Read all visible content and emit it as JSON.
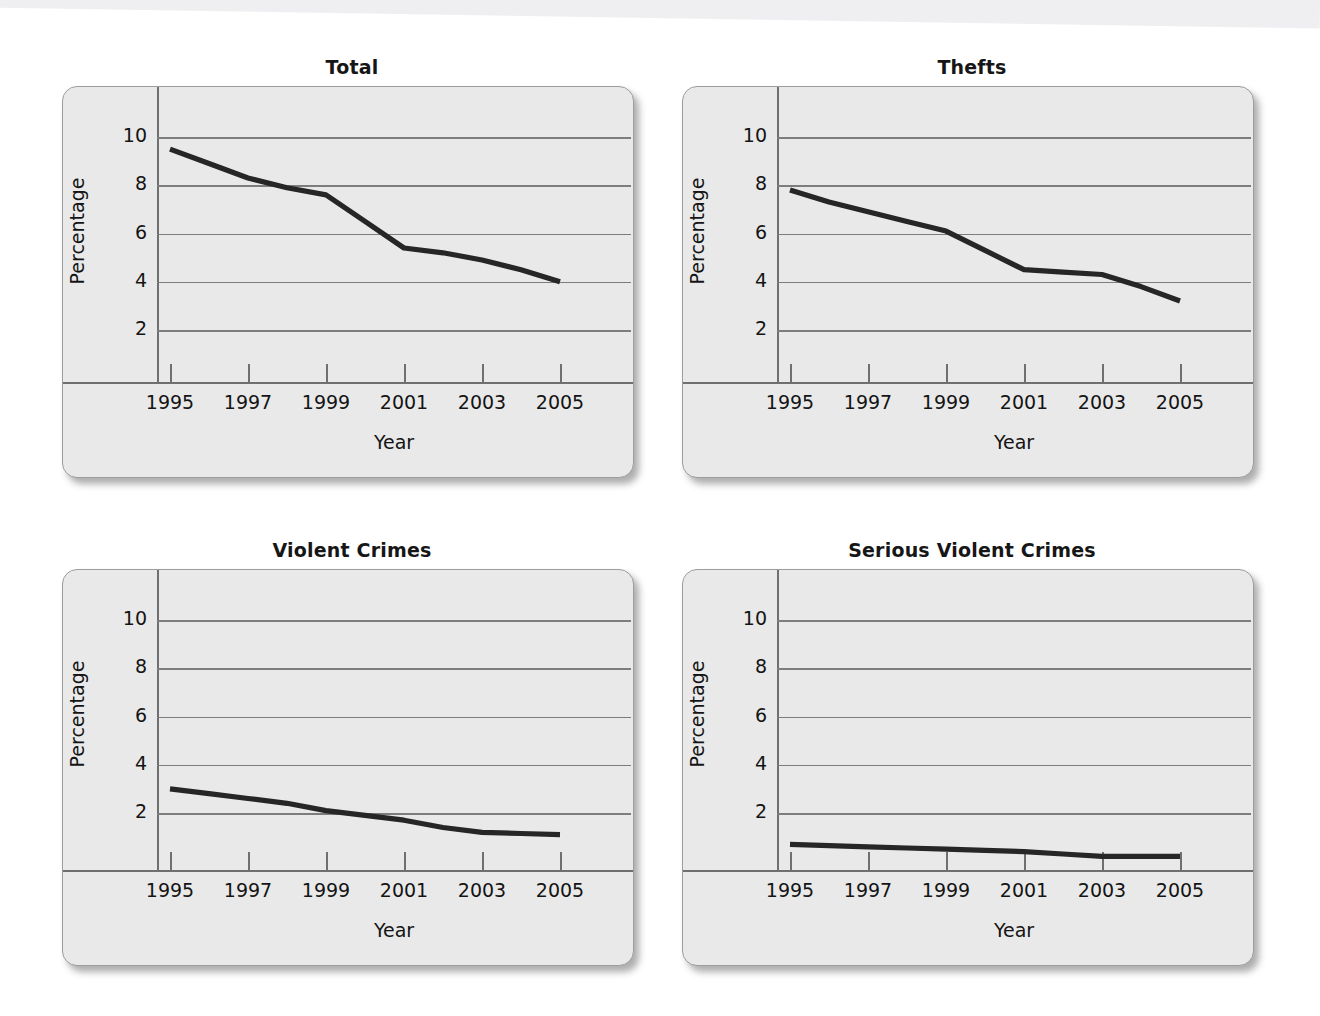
{
  "figure": {
    "layout": "2x2 grid of line charts",
    "shared_ylabel": "Percentage",
    "shared_xlabel": "Year",
    "line_color": "#262626",
    "panel_color": "#e9e9e9",
    "page_color": "#ffffff"
  },
  "chart_data": [
    {
      "type": "line",
      "title": "Total",
      "xlabel": "Year",
      "ylabel": "Percentage",
      "x": [
        1995,
        1996,
        1997,
        1998,
        1999,
        2000,
        2001,
        2002,
        2003,
        2004,
        2005
      ],
      "xtick_labels": [
        "1995",
        "1997",
        "1999",
        "2001",
        "2003",
        "2005"
      ],
      "xticks": [
        1995,
        1997,
        1999,
        2001,
        2003,
        2005
      ],
      "ytick_labels": [
        "2",
        "4",
        "6",
        "8",
        "10"
      ],
      "yticks": [
        2,
        4,
        6,
        8,
        10
      ],
      "values": [
        9.5,
        8.9,
        8.3,
        7.9,
        7.6,
        6.5,
        5.4,
        5.2,
        4.9,
        4.5,
        4.0
      ],
      "xlim": [
        1994,
        2006
      ],
      "ylim": [
        0,
        11.5
      ],
      "grid": "horizontal",
      "legend": "none"
    },
    {
      "type": "line",
      "title": "Thefts",
      "xlabel": "Year",
      "ylabel": "Percentage",
      "x": [
        1995,
        1996,
        1997,
        1998,
        1999,
        2000,
        2001,
        2002,
        2003,
        2004,
        2005
      ],
      "xtick_labels": [
        "1995",
        "1997",
        "1999",
        "2001",
        "2003",
        "2005"
      ],
      "xticks": [
        1995,
        1997,
        1999,
        2001,
        2003,
        2005
      ],
      "ytick_labels": [
        "2",
        "4",
        "6",
        "8",
        "10"
      ],
      "yticks": [
        2,
        4,
        6,
        8,
        10
      ],
      "values": [
        7.8,
        7.3,
        6.9,
        6.5,
        6.1,
        5.3,
        4.5,
        4.4,
        4.3,
        3.8,
        3.2
      ],
      "xlim": [
        1994,
        2006
      ],
      "ylim": [
        0,
        11.5
      ],
      "grid": "horizontal",
      "legend": "none"
    },
    {
      "type": "line",
      "title": "Violent Crimes",
      "xlabel": "Year",
      "ylabel": "Percentage",
      "x": [
        1995,
        1996,
        1997,
        1998,
        1999,
        2000,
        2001,
        2002,
        2003,
        2004,
        2005
      ],
      "xtick_labels": [
        "1995",
        "1997",
        "1999",
        "2001",
        "2003",
        "2005"
      ],
      "xticks": [
        1995,
        1997,
        1999,
        2001,
        2003,
        2005
      ],
      "ytick_labels": [
        "2",
        "4",
        "6",
        "8",
        "10"
      ],
      "yticks": [
        2,
        4,
        6,
        8,
        10
      ],
      "values": [
        3.0,
        2.8,
        2.6,
        2.4,
        2.1,
        1.9,
        1.7,
        1.4,
        1.2,
        1.15,
        1.1
      ],
      "xlim": [
        1994,
        2006
      ],
      "ylim": [
        0,
        11.5
      ],
      "grid": "horizontal",
      "legend": "none"
    },
    {
      "type": "line",
      "title": "Serious Violent Crimes",
      "xlabel": "Year",
      "ylabel": "Percentage",
      "x": [
        1995,
        1996,
        1997,
        1998,
        1999,
        2000,
        2001,
        2002,
        2003,
        2004,
        2005
      ],
      "xtick_labels": [
        "1995",
        "1997",
        "1999",
        "2001",
        "2003",
        "2005"
      ],
      "xticks": [
        1995,
        1997,
        1999,
        2001,
        2003,
        2005
      ],
      "ytick_labels": [
        "2",
        "4",
        "6",
        "8",
        "10"
      ],
      "yticks": [
        2,
        4,
        6,
        8,
        10
      ],
      "values": [
        0.7,
        0.65,
        0.6,
        0.55,
        0.5,
        0.45,
        0.4,
        0.3,
        0.2,
        0.2,
        0.2
      ],
      "xlim": [
        1994,
        2006
      ],
      "ylim": [
        0,
        11.5
      ],
      "grid": "horizontal",
      "legend": "none"
    }
  ]
}
